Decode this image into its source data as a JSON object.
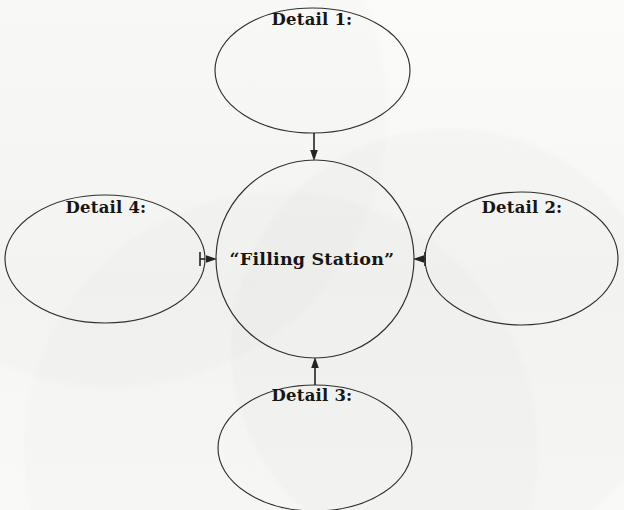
{
  "diagram": {
    "type": "spider-map",
    "background_color": "#f8f8f7",
    "stroke_color": "#30302f",
    "text_color": "#161615",
    "center": {
      "id": "center",
      "label": "“Filling Station”",
      "shape": "circle"
    },
    "nodes": [
      {
        "id": "detail-1",
        "label": "Detail 1:",
        "shape": "ellipse",
        "position": "top"
      },
      {
        "id": "detail-2",
        "label": "Detail 2:",
        "shape": "ellipse",
        "position": "right"
      },
      {
        "id": "detail-3",
        "label": "Detail 3:",
        "shape": "ellipse",
        "position": "bottom"
      },
      {
        "id": "detail-4",
        "label": "Detail 4:",
        "shape": "ellipse",
        "position": "left"
      }
    ],
    "connectors": [
      {
        "id": "connector-top",
        "from": "detail-1",
        "to": "center",
        "arrow_direction": "down"
      },
      {
        "id": "connector-right",
        "from": "detail-2",
        "to": "center",
        "arrow_direction": "left"
      },
      {
        "id": "connector-bottom",
        "from": "detail-3",
        "to": "center",
        "arrow_direction": "up"
      },
      {
        "id": "connector-left",
        "from": "detail-4",
        "to": "center",
        "arrow_direction": "right"
      }
    ]
  }
}
